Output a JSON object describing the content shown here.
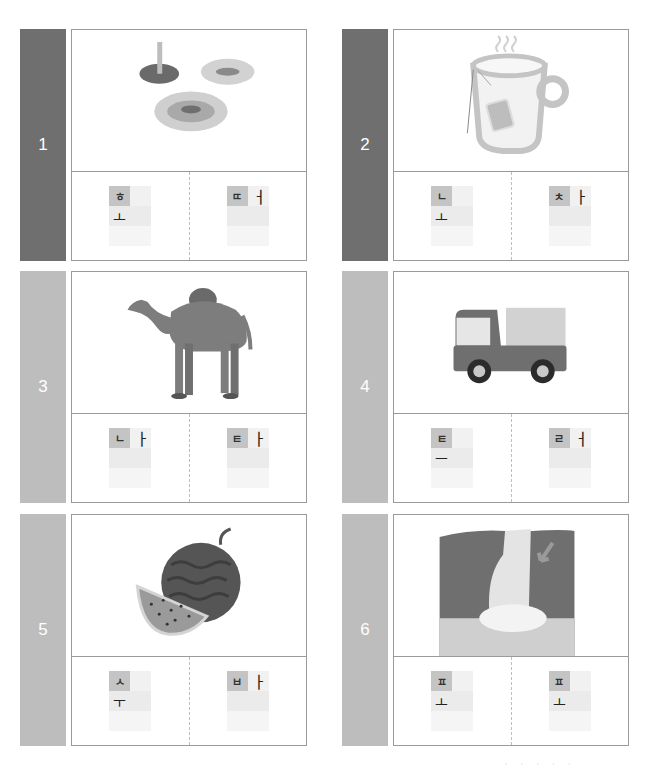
{
  "worksheet": {
    "colors": {
      "panel_dark": "#6f6f6f",
      "panel_light": "#bdbdbd",
      "consonant_box": "#c4c4c4"
    },
    "cards": [
      {
        "number": "1",
        "picture": "jellyfish-icon",
        "panel": "dark",
        "slots": [
          {
            "consonant": "ㅎ",
            "vowel_right": "",
            "vowel_below": "ㅗ"
          },
          {
            "consonant": "ㄸ",
            "vowel_right": "ㅓ",
            "vowel_below": ""
          }
        ]
      },
      {
        "number": "2",
        "picture": "tea-cup-icon",
        "panel": "dark",
        "slots": [
          {
            "consonant": "ㄴ",
            "vowel_right": "",
            "vowel_below": "ㅗ"
          },
          {
            "consonant": "ㅊ",
            "vowel_right": "ㅏ",
            "vowel_below": ""
          }
        ]
      },
      {
        "number": "3",
        "picture": "camel-icon",
        "panel": "light",
        "slots": [
          {
            "consonant": "ㄴ",
            "vowel_right": "ㅏ",
            "vowel_below": ""
          },
          {
            "consonant": "ㅌ",
            "vowel_right": "ㅏ",
            "vowel_below": ""
          }
        ]
      },
      {
        "number": "4",
        "picture": "truck-icon",
        "panel": "light",
        "slots": [
          {
            "consonant": "ㅌ",
            "vowel_right": "",
            "vowel_below": "ㅡ"
          },
          {
            "consonant": "ㄹ",
            "vowel_right": "ㅓ",
            "vowel_below": ""
          }
        ]
      },
      {
        "number": "5",
        "picture": "watermelon-icon",
        "panel": "light",
        "slots": [
          {
            "consonant": "ㅅ",
            "vowel_right": "",
            "vowel_below": "ㅜ"
          },
          {
            "consonant": "ㅂ",
            "vowel_right": "ㅏ",
            "vowel_below": ""
          }
        ]
      },
      {
        "number": "6",
        "picture": "waterfall-icon",
        "panel": "light",
        "slots": [
          {
            "consonant": "ㅍ",
            "vowel_right": "",
            "vowel_below": "ㅗ"
          },
          {
            "consonant": "ㅍ",
            "vowel_right": "",
            "vowel_below": "ㅗ"
          }
        ]
      }
    ]
  }
}
